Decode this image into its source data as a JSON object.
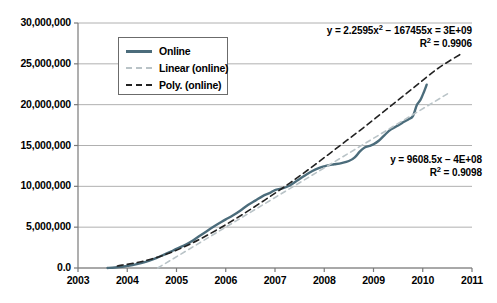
{
  "chart_data": {
    "type": "line",
    "title": "",
    "xlabel": "",
    "ylabel": "",
    "xlim": [
      2003,
      2011
    ],
    "ylim": [
      0,
      30000000
    ],
    "grid": true,
    "legend_position": "top-left",
    "xticks": [
      "2003",
      "2004",
      "2005",
      "2006",
      "2007",
      "2008",
      "2009",
      "2010",
      "2011"
    ],
    "xtick_values": [
      2003,
      2004,
      2005,
      2006,
      2007,
      2008,
      2009,
      2010,
      2011
    ],
    "yticks": [
      "0.0",
      "5,000,000",
      "10,000,000",
      "15,000,000",
      "20,000,000",
      "25,000,000",
      "30,000,000"
    ],
    "ytick_values": [
      0,
      5000000,
      10000000,
      15000000,
      20000000,
      25000000,
      30000000
    ],
    "series": [
      {
        "name": "Online",
        "style": "solid",
        "color": "#4b6c7b",
        "x": [
          2003.6,
          2003.75,
          2003.9,
          2004.0,
          2004.15,
          2004.3,
          2004.45,
          2004.6,
          2004.75,
          2004.9,
          2005.0,
          2005.15,
          2005.3,
          2005.45,
          2005.6,
          2005.75,
          2005.9,
          2006.0,
          2006.15,
          2006.3,
          2006.45,
          2006.6,
          2006.75,
          2006.9,
          2007.0,
          2007.15,
          2007.3,
          2007.45,
          2007.6,
          2007.75,
          2007.9,
          2008.0,
          2008.1,
          2008.2,
          2008.35,
          2008.5,
          2008.62,
          2008.72,
          2008.82,
          2008.92,
          2009.0,
          2009.1,
          2009.22,
          2009.35,
          2009.5,
          2009.62,
          2009.72,
          2009.8,
          2009.88,
          2009.95,
          2010.02,
          2010.08
        ],
        "y": [
          0,
          60000,
          150000,
          260000,
          420000,
          620000,
          900000,
          1250000,
          1650000,
          2050000,
          2350000,
          2750000,
          3250000,
          3850000,
          4450000,
          5050000,
          5600000,
          5950000,
          6450000,
          7050000,
          7700000,
          8250000,
          8800000,
          9200000,
          9550000,
          9750000,
          10100000,
          10700000,
          11300000,
          11850000,
          12250000,
          12450000,
          12600000,
          12700000,
          12850000,
          13100000,
          13550000,
          14250000,
          14750000,
          14950000,
          15150000,
          15550000,
          16250000,
          16950000,
          17450000,
          17900000,
          18250000,
          18600000,
          19950000,
          20550000,
          21500000,
          22450000
        ]
      },
      {
        "name": "Linear (online)",
        "style": "dashed",
        "color": "#b9c3c7",
        "equation": "y = 9608.5x − 4E+08",
        "r_squared_label": "R² = 0.9098",
        "r_squared": 0.9098,
        "slope": 9608.5,
        "intercept_label": "-4E+08",
        "x": [
          2004.62,
          2010.55
        ],
        "y": [
          0,
          21500000
        ]
      },
      {
        "name": "Poly. (online)",
        "style": "dashed",
        "color": "#222222",
        "equation": "y = 2.2595x² − 167455x = 3E+09",
        "r_squared_label": "R² = 0.9906",
        "r_squared": 0.9906,
        "quad_coeff": 2.2595,
        "lin_coeff": -167455,
        "const_label": "3E+09",
        "x": [
          2003.8,
          2004.3,
          2004.8,
          2005.3,
          2005.8,
          2006.3,
          2006.8,
          2007.3,
          2007.8,
          2008.3,
          2008.8,
          2009.3,
          2009.8,
          2010.3,
          2010.8
        ],
        "y": [
          250000,
          800000,
          1700000,
          3000000,
          4600000,
          6400000,
          8350000,
          10400000,
          12600000,
          14900000,
          17200000,
          19600000,
          22000000,
          24400000,
          26300000
        ]
      }
    ]
  },
  "legend": {
    "items": [
      {
        "label": "Online",
        "swatch": "solid-line-swatch"
      },
      {
        "label": "Linear (online)",
        "swatch": "light-dashed-line-swatch"
      },
      {
        "label": "Poly. (online)",
        "swatch": "dark-dashed-line-swatch"
      }
    ]
  },
  "annotations": {
    "poly": {
      "line1_prefix": "y = 2.2595x",
      "line1_sup": "2",
      "line1_suffix": " − 167455x = 3E+09",
      "line2_prefix": "R",
      "line2_sup": "2",
      "line2_suffix": " = 0.9906"
    },
    "linear": {
      "line1": "y = 9608.5x − 4E+08",
      "line2_prefix": "R",
      "line2_sup": "2",
      "line2_suffix": " = 0.9098"
    }
  },
  "colors": {
    "series_online": "#4b6c7b",
    "trend_linear": "#b9c3c7",
    "trend_poly": "#222222",
    "gridline": "#b0b0b0",
    "axis": "#7a7a7a",
    "text": "#000000"
  }
}
